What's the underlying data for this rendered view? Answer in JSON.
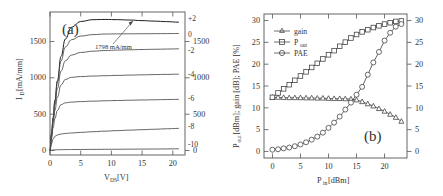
{
  "figure": {
    "panels": [
      {
        "id": "a",
        "label": "(a)",
        "xlabel_main": "V",
        "xlabel_sub": "DS",
        "xlabel_unit": " [V]",
        "ylabel_main": "I",
        "ylabel_sub": "D",
        "ylabel_unit": " [mA/mm]",
        "annotation": "1798 mA/mm",
        "xticks": [
          "0",
          "5",
          "10",
          "15",
          "20"
        ],
        "yticks": [
          "0",
          "500",
          "1000",
          "1500"
        ],
        "yticks_right": [
          "0",
          "500",
          "1000",
          "1500"
        ],
        "curve_labels": [
          "+2",
          "0",
          "-2",
          "-4",
          "-6",
          "-8",
          "-10"
        ]
      },
      {
        "id": "b",
        "label": "(b)",
        "xlabel_main": "P",
        "xlabel_sub": "in",
        "xlabel_unit": " [dBm]",
        "ylabel_text": "P_out [dBm]; gain [dB]; PAE [%]",
        "xticks": [
          "0",
          "5",
          "10",
          "15",
          "20"
        ],
        "yticks": [
          "0",
          "5",
          "10",
          "15",
          "20",
          "25",
          "30"
        ],
        "yticks_right": [
          "0",
          "5",
          "10",
          "15",
          "20",
          "25",
          "30"
        ],
        "legend": [
          {
            "label": "gain",
            "marker": "triangle-up-marker"
          },
          {
            "label": "P",
            "sub": "out",
            "marker": "square-marker"
          },
          {
            "label": "PAE",
            "marker": "circle-marker"
          }
        ]
      }
    ]
  },
  "chart_data": [
    {
      "type": "line",
      "panel": "a",
      "title": "(a)",
      "xlabel": "V_DS [V]",
      "ylabel": "I_D [mA/mm]",
      "xlim": [
        0,
        22
      ],
      "ylim": [
        -60,
        1900
      ],
      "xticks": [
        0,
        5,
        10,
        15,
        20
      ],
      "yticks": [
        0,
        500,
        1000,
        1500
      ],
      "grid": false,
      "annotations": [
        {
          "text": "1798 mA/mm",
          "x": 8.0,
          "y": 1510,
          "points_to": {
            "x": 14.5,
            "y": 1798
          }
        }
      ],
      "legend_position": "right-of-curves",
      "series": [
        {
          "name": "V_GS = +2 V",
          "label": "+2",
          "knee_v": 3.4,
          "saturation_ma_per_mm": 1798,
          "x": [
            0,
            0.25,
            0.5,
            0.8,
            1.2,
            1.8,
            2.5,
            3.5,
            5,
            7,
            9,
            11,
            13,
            15,
            17,
            19,
            21
          ],
          "y": [
            0,
            230,
            450,
            690,
            960,
            1290,
            1530,
            1690,
            1770,
            1795,
            1798,
            1795,
            1790,
            1782,
            1775,
            1768,
            1760
          ]
        },
        {
          "name": "V_GS = 0 V",
          "label": "0",
          "knee_v": 3.0,
          "saturation_ma_per_mm": 1600,
          "x": [
            0,
            0.25,
            0.5,
            0.8,
            1.2,
            1.8,
            2.5,
            3.5,
            5,
            7,
            9,
            11,
            13,
            15,
            17,
            19,
            21
          ],
          "y": [
            0,
            225,
            440,
            670,
            930,
            1230,
            1420,
            1520,
            1570,
            1590,
            1598,
            1600,
            1601,
            1602,
            1603,
            1604,
            1605
          ]
        },
        {
          "name": "V_GS = -2 V",
          "label": "-2",
          "knee_v": 2.6,
          "saturation_ma_per_mm": 1380,
          "x": [
            0,
            0.25,
            0.5,
            0.8,
            1.2,
            1.8,
            2.5,
            3.5,
            5,
            7,
            9,
            11,
            13,
            15,
            17,
            19,
            21
          ],
          "y": [
            0,
            215,
            415,
            625,
            850,
            1090,
            1230,
            1310,
            1345,
            1363,
            1372,
            1378,
            1382,
            1386,
            1389,
            1392,
            1395
          ]
        },
        {
          "name": "V_GS = -4 V",
          "label": "-4",
          "knee_v": 2.2,
          "saturation_ma_per_mm": 1030,
          "x": [
            0,
            0.25,
            0.5,
            0.8,
            1.2,
            1.8,
            2.5,
            3.5,
            5,
            7,
            9,
            11,
            13,
            15,
            17,
            19,
            21
          ],
          "y": [
            0,
            195,
            375,
            550,
            730,
            900,
            975,
            1005,
            1015,
            1022,
            1027,
            1031,
            1035,
            1039,
            1042,
            1045,
            1048
          ]
        },
        {
          "name": "V_GS = -6 V",
          "label": "-6",
          "knee_v": 1.8,
          "saturation_ma_per_mm": 700,
          "x": [
            0,
            0.25,
            0.5,
            0.8,
            1.2,
            1.8,
            2.5,
            3.5,
            5,
            7,
            9,
            11,
            13,
            15,
            17,
            19,
            21
          ],
          "y": [
            0,
            165,
            310,
            440,
            550,
            630,
            655,
            665,
            672,
            678,
            683,
            687,
            691,
            694,
            697,
            700,
            703
          ]
        },
        {
          "name": "V_GS = -8 V",
          "label": "-8",
          "knee_v": 1.4,
          "saturation_ma_per_mm": 300,
          "x": [
            0,
            0.25,
            0.5,
            0.8,
            1.2,
            1.8,
            2.5,
            3.5,
            5,
            7,
            9,
            11,
            13,
            15,
            17,
            19,
            21
          ],
          "y": [
            0,
            95,
            160,
            195,
            215,
            228,
            235,
            242,
            250,
            259,
            267,
            274,
            281,
            287,
            293,
            299,
            305
          ]
        },
        {
          "name": "V_GS = -10 V",
          "label": "-10",
          "knee_v": 1.0,
          "saturation_ma_per_mm": 20,
          "x": [
            0,
            0.25,
            0.5,
            0.8,
            1.2,
            1.8,
            2.5,
            3.5,
            5,
            7,
            9,
            11,
            13,
            15,
            17,
            19,
            21
          ],
          "y": [
            0,
            6,
            9,
            11,
            12,
            13,
            14,
            15,
            16,
            17,
            18,
            19,
            20,
            21,
            22,
            23,
            25
          ]
        }
      ]
    },
    {
      "type": "line",
      "panel": "b",
      "title": "(b)",
      "xlabel": "P_in [dBm]",
      "ylabel": "P_out [dBm]; gain [dB]; PAE [%]",
      "xlim": [
        -1.5,
        24
      ],
      "ylim": [
        -1.5,
        31.5
      ],
      "xticks": [
        0,
        5,
        10,
        15,
        20
      ],
      "yticks": [
        0,
        5,
        10,
        15,
        20,
        25,
        30
      ],
      "grid": false,
      "legend_position": "upper-left",
      "series": [
        {
          "name": "gain",
          "unit": "dB",
          "marker": "triangle-up-marker",
          "x": [
            0,
            1,
            2,
            3,
            4,
            5,
            6,
            7,
            8,
            9,
            10,
            11,
            12,
            13,
            14,
            15,
            16,
            17,
            18,
            19,
            20,
            21,
            22,
            23
          ],
          "y": [
            12.4,
            12.4,
            12.35,
            12.3,
            12.3,
            12.3,
            12.25,
            12.25,
            12.2,
            12.2,
            12.15,
            12.1,
            12.1,
            12.05,
            12.0,
            11.8,
            11.4,
            10.9,
            10.4,
            9.8,
            9.2,
            8.5,
            7.8,
            6.9
          ]
        },
        {
          "name": "P_out",
          "unit": "dBm",
          "marker": "square-marker",
          "x": [
            0,
            1,
            2,
            3,
            4,
            5,
            6,
            7,
            8,
            9,
            10,
            11,
            12,
            13,
            14,
            15,
            16,
            17,
            18,
            19,
            20,
            21,
            22,
            23
          ],
          "y": [
            12.4,
            13.4,
            14.35,
            15.3,
            16.3,
            17.3,
            18.25,
            19.25,
            20.2,
            21.2,
            22.15,
            23.1,
            24.1,
            25.05,
            26.0,
            26.8,
            27.4,
            27.9,
            28.4,
            28.8,
            29.2,
            29.5,
            29.8,
            29.9
          ]
        },
        {
          "name": "PAE",
          "unit": "%",
          "marker": "circle-marker",
          "x": [
            0,
            1,
            2,
            3,
            4,
            5,
            6,
            7,
            8,
            9,
            10,
            11,
            12,
            13,
            14,
            15,
            16,
            17,
            18,
            19,
            20,
            21,
            22,
            23
          ],
          "y": [
            0.4,
            0.5,
            0.7,
            0.9,
            1.2,
            1.6,
            2.1,
            2.7,
            3.4,
            4.3,
            5.4,
            6.6,
            8.0,
            9.6,
            11.2,
            13.0,
            14.8,
            17.6,
            20.4,
            22.8,
            25.4,
            27.2,
            28.6,
            29.2
          ]
        }
      ]
    }
  ]
}
